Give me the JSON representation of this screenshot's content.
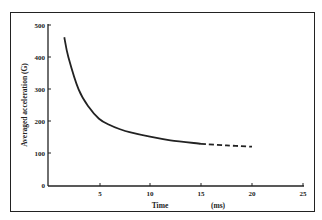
{
  "chart_data": {
    "type": "line",
    "title": "",
    "xlabel": "Time",
    "xunit": "(ms)",
    "ylabel": "Averaged acceleration (G)",
    "xlim": [
      0,
      25
    ],
    "ylim": [
      0,
      500
    ],
    "xticks": [
      5,
      10,
      15,
      20,
      25
    ],
    "yticks": [
      0,
      100,
      200,
      300,
      400,
      500
    ],
    "grid": false,
    "legend": null,
    "series": [
      {
        "name": "measured",
        "style": "solid",
        "x": [
          1.6,
          2,
          3,
          4,
          5,
          6,
          7,
          8,
          10,
          12,
          15
        ],
        "y": [
          462,
          400,
          300,
          245,
          209,
          190,
          177,
          167,
          153,
          142,
          131
        ]
      },
      {
        "name": "extrapolated",
        "style": "dashed",
        "x": [
          15,
          17.5,
          20
        ],
        "y": [
          131,
          126,
          122
        ]
      }
    ]
  },
  "labels": {
    "x_title": "Time",
    "x_unit": "(ms)",
    "y_title": "Averaged acceleration (G)",
    "x_ticks": [
      "5",
      "10",
      "15",
      "20",
      "25"
    ],
    "y_ticks": [
      "0",
      "100",
      "200",
      "300",
      "400",
      "500"
    ]
  },
  "colors": {
    "ink": "#222222",
    "background": "#ffffff"
  }
}
